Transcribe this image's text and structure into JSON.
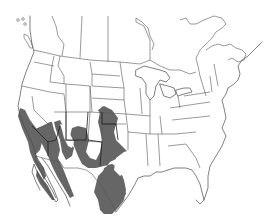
{
  "map": {
    "type": "species-range-map",
    "region": "North America (Canada, United States, Mexico)",
    "colors": {
      "background": "#ffffff",
      "outline": "#4a4a4a",
      "range_fill": "#666666",
      "range_border": "#1e1e1e"
    },
    "range": {
      "description": "Shaded distribution across US Southwest and northern Mexico",
      "areas": [
        "Southern California / Baja California",
        "Southern Nevada",
        "Arizona",
        "Utah (southern)",
        "Colorado (western and eastern)",
        "New Mexico",
        "Western Texas",
        "Oklahoma panhandle / western Kansas",
        "Sonora",
        "Chihuahua",
        "Coahuila / Nuevo Leon / Tamaulipas"
      ]
    }
  }
}
